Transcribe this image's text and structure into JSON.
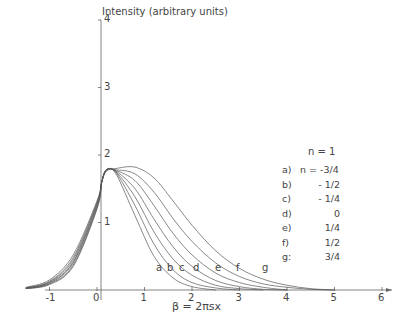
{
  "chart_data": {
    "type": "line",
    "title": "",
    "xlabel": "β = 2πsx",
    "ylabel": "Intensity (arbitrary units)",
    "xlim": [
      -1.6,
      6.2
    ],
    "ylim": [
      0,
      4
    ],
    "xticks": [
      -1,
      0,
      1,
      2,
      3,
      4,
      5,
      6
    ],
    "yticks": [
      1,
      2,
      3,
      4
    ],
    "grid": false,
    "annotation_header": "n = 1",
    "legend": [
      {
        "key": "a)",
        "value": "n = -3/4"
      },
      {
        "key": "b)",
        "value": "- 1/2"
      },
      {
        "key": "c)",
        "value": "- 1/4"
      },
      {
        "key": "d)",
        "value": "0"
      },
      {
        "key": "e)",
        "value": "1/4"
      },
      {
        "key": "f)",
        "value": "1/2"
      },
      {
        "key": "g:",
        "value": "3/4"
      }
    ],
    "curve_labels": [
      "a",
      "b",
      "c",
      "d",
      "e",
      "f",
      "g"
    ],
    "series": [
      {
        "name": "a",
        "n": -0.75,
        "x": [
          -1.5,
          -1,
          -0.5,
          0,
          0.1,
          0.2,
          0.4,
          0.8,
          1.2,
          1.6,
          2.0,
          2.5
        ],
        "y": [
          0.02,
          0.08,
          0.35,
          1.2,
          1.6,
          1.78,
          1.72,
          1.1,
          0.5,
          0.18,
          0.05,
          0
        ]
      },
      {
        "name": "b",
        "n": -0.5,
        "x": [
          -1.5,
          -1,
          -0.5,
          0,
          0.1,
          0.2,
          0.4,
          0.8,
          1.2,
          1.6,
          2.0,
          2.5,
          3.0
        ],
        "y": [
          0.02,
          0.09,
          0.37,
          1.22,
          1.6,
          1.78,
          1.74,
          1.25,
          0.68,
          0.3,
          0.11,
          0.03,
          0
        ]
      },
      {
        "name": "c",
        "n": -0.25,
        "x": [
          -1.5,
          -1,
          -0.5,
          0,
          0.1,
          0.2,
          0.4,
          0.8,
          1.2,
          1.6,
          2.0,
          2.5,
          3.0,
          3.5
        ],
        "y": [
          0.02,
          0.1,
          0.4,
          1.24,
          1.6,
          1.78,
          1.75,
          1.38,
          0.86,
          0.46,
          0.22,
          0.07,
          0.02,
          0
        ]
      },
      {
        "name": "d",
        "n": 0,
        "x": [
          -1.5,
          -1,
          -0.5,
          0,
          0.1,
          0.2,
          0.4,
          0.8,
          1.2,
          1.6,
          2.0,
          2.5,
          3.0,
          3.5,
          4.0
        ],
        "y": [
          0.03,
          0.11,
          0.42,
          1.26,
          1.6,
          1.78,
          1.76,
          1.5,
          1.05,
          0.64,
          0.35,
          0.14,
          0.05,
          0.01,
          0
        ]
      },
      {
        "name": "e",
        "n": 0.25,
        "x": [
          -1.5,
          -1,
          -0.5,
          0,
          0.1,
          0.2,
          0.4,
          0.8,
          1.2,
          1.6,
          2.0,
          2.5,
          3.0,
          3.5,
          4.0
        ],
        "y": [
          0.03,
          0.12,
          0.45,
          1.28,
          1.6,
          1.78,
          1.77,
          1.62,
          1.25,
          0.84,
          0.52,
          0.25,
          0.11,
          0.04,
          0
        ]
      },
      {
        "name": "f",
        "n": 0.5,
        "x": [
          -1.5,
          -1,
          -0.5,
          0,
          0.1,
          0.2,
          0.4,
          0.8,
          1.2,
          1.6,
          2.0,
          2.5,
          3.0,
          3.5,
          4.0,
          4.5,
          5.0
        ],
        "y": [
          0.03,
          0.13,
          0.48,
          1.3,
          1.6,
          1.78,
          1.78,
          1.72,
          1.45,
          1.06,
          0.72,
          0.4,
          0.2,
          0.09,
          0.04,
          0.01,
          0
        ]
      },
      {
        "name": "g",
        "n": 0.75,
        "x": [
          -1.5,
          -1,
          -0.5,
          0,
          0.1,
          0.2,
          0.4,
          0.8,
          1.2,
          1.6,
          2.0,
          2.5,
          3.0,
          3.5,
          4.0,
          4.5,
          5.0
        ],
        "y": [
          0.04,
          0.15,
          0.52,
          1.32,
          1.6,
          1.76,
          1.8,
          1.82,
          1.66,
          1.32,
          0.96,
          0.58,
          0.32,
          0.16,
          0.07,
          0.02,
          0
        ]
      }
    ]
  }
}
